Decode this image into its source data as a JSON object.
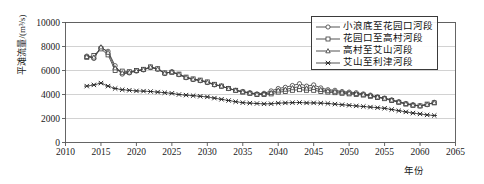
{
  "chart_data": {
    "type": "line",
    "title": "",
    "xlabel": "年份",
    "ylabel": "平滩流量/(m³/s)",
    "xlim": [
      2010,
      2065
    ],
    "ylim": [
      0,
      10000
    ],
    "xticks": [
      2010,
      2015,
      2020,
      2025,
      2030,
      2035,
      2040,
      2045,
      2050,
      2055,
      2060,
      2065
    ],
    "yticks": [
      0,
      2000,
      4000,
      6000,
      8000,
      10000
    ],
    "grid": "horizontal",
    "legend_position": "top-right",
    "x": [
      2013,
      2014,
      2015,
      2016,
      2017,
      2018,
      2019,
      2020,
      2021,
      2022,
      2023,
      2024,
      2025,
      2026,
      2027,
      2028,
      2029,
      2030,
      2031,
      2032,
      2033,
      2034,
      2035,
      2036,
      2037,
      2038,
      2039,
      2040,
      2041,
      2042,
      2043,
      2044,
      2045,
      2046,
      2047,
      2048,
      2049,
      2050,
      2051,
      2052,
      2053,
      2054,
      2055,
      2056,
      2057,
      2058,
      2059,
      2060,
      2061,
      2062
    ],
    "series": [
      {
        "name": "小浪底至花园口河段",
        "marker": "circle",
        "values": [
          7200,
          7000,
          7900,
          7600,
          6400,
          5700,
          5800,
          5950,
          6050,
          6250,
          6100,
          5750,
          5900,
          5650,
          5400,
          5250,
          5150,
          5000,
          4800,
          4700,
          4500,
          4350,
          4250,
          4150,
          4050,
          4100,
          4300,
          4500,
          4600,
          4750,
          4900,
          4700,
          4800,
          4550,
          4400,
          4350,
          4250,
          4200,
          4150,
          4050,
          3950,
          3800,
          3700,
          3550,
          3400,
          3250,
          3150,
          3050,
          3150,
          3350
        ]
      },
      {
        "name": "花园口至高村河段",
        "marker": "square",
        "values": [
          7100,
          7250,
          7800,
          7300,
          6000,
          5950,
          5900,
          6000,
          6100,
          6300,
          6150,
          5800,
          5850,
          5700,
          5450,
          5300,
          5200,
          5050,
          4850,
          4700,
          4500,
          4350,
          4200,
          4100,
          4000,
          4000,
          4050,
          4200,
          4250,
          4350,
          4400,
          4350,
          4350,
          4250,
          4200,
          4150,
          4100,
          4050,
          4000,
          3950,
          3850,
          3750,
          3650,
          3500,
          3350,
          3200,
          3100,
          3050,
          3200,
          3300
        ]
      },
      {
        "name": "高村至艾山河段",
        "marker": "triangle",
        "values": [
          7150,
          7100,
          7950,
          7500,
          6200,
          5800,
          5850,
          5980,
          6080,
          6280,
          6120,
          5780,
          5880,
          5670,
          5420,
          5270,
          5170,
          5020,
          4820,
          4700,
          4490,
          4340,
          4220,
          4120,
          4020,
          4050,
          4150,
          4350,
          4420,
          4550,
          4650,
          4520,
          4570,
          4400,
          4300,
          4250,
          4170,
          4120,
          4070,
          4000,
          3900,
          3780,
          3680,
          3530,
          3380,
          3230,
          3120,
          3050,
          3170,
          3320
        ]
      },
      {
        "name": "艾山至利津河段",
        "marker": "cross",
        "values": [
          4700,
          4800,
          4950,
          4700,
          4500,
          4400,
          4350,
          4300,
          4280,
          4250,
          4200,
          4150,
          4100,
          4000,
          3950,
          3900,
          3850,
          3800,
          3700,
          3600,
          3500,
          3400,
          3320,
          3280,
          3250,
          3220,
          3230,
          3280,
          3300,
          3320,
          3330,
          3300,
          3300,
          3280,
          3250,
          3200,
          3150,
          3100,
          3050,
          3000,
          2950,
          2900,
          2850,
          2750,
          2650,
          2550,
          2450,
          2380,
          2300,
          2250
        ]
      }
    ]
  },
  "axis": {
    "y_tick_labels": [
      "10000",
      "8000",
      "6000",
      "4000",
      "2000",
      "0"
    ],
    "x_tick_labels": [
      "2010",
      "2015",
      "2020",
      "2025",
      "2030",
      "2035",
      "2040",
      "2045",
      "2050",
      "2055",
      "2060",
      "2065"
    ]
  },
  "colors": {
    "series_line": "#404040",
    "axis": "#555555",
    "grid": "#bfbfbf",
    "text": "#1a1a1a"
  }
}
